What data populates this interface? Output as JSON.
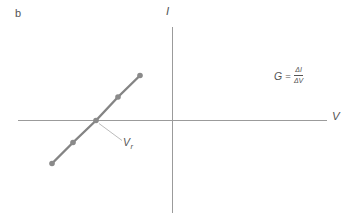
{
  "figure": {
    "panel_label": "b",
    "y_axis_label": "I",
    "x_axis_label": "V",
    "intercept_label": {
      "base": "V",
      "sub": "r"
    },
    "formula": {
      "lhs": "G",
      "eq": "=",
      "numerator": "ΔI",
      "denominator": "ΔV"
    }
  },
  "colors": {
    "background": "#ffffff",
    "axis": "#9b9b9b",
    "data_line": "#848484",
    "marker": "#8a8a8a",
    "leader": "#aaaaaa",
    "text": "#545454"
  },
  "chart_data": {
    "type": "line",
    "title": "",
    "xlabel": "V",
    "ylabel": "I",
    "legend": "none",
    "grid": false,
    "axes_px": {
      "x_axis_y": 120.5,
      "x_start": 18,
      "x_end": 327,
      "y_axis_x": 172.5,
      "y_start": 27,
      "y_end": 213
    },
    "series": [
      {
        "name": "I-V data line",
        "marker": "circle",
        "marker_radius": 2.8,
        "line_width": 2.4,
        "points_px": [
          [
            52,
            163.5
          ],
          [
            73,
            142.5
          ],
          [
            96,
            120.5
          ],
          [
            118,
            97
          ],
          [
            140,
            75.5
          ]
        ],
        "points_axis_units": [
          [
            -120,
            -43
          ],
          [
            -99,
            -22
          ],
          [
            -76,
            0
          ],
          [
            -54,
            23
          ],
          [
            -32,
            45
          ]
        ]
      }
    ],
    "reversal_point_px": [
      96,
      120.5
    ],
    "leader_px": [
      [
        99,
        123.5
      ],
      [
        122,
        140.5
      ]
    ],
    "axis_units_note": "no numeric tick labels shown; units arbitrary, origin at axis crossing"
  }
}
